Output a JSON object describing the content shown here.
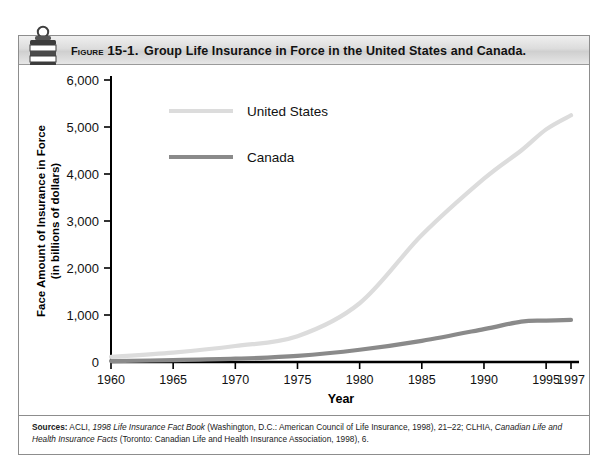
{
  "figure": {
    "label_word": "Figure",
    "label_number": "15-1.",
    "title": "Group Life Insurance in Force in the United States and Canada.",
    "icon": "ribbon-banner-icon"
  },
  "source": {
    "label": "Sources:",
    "segments": [
      {
        "text": " ACLI, ",
        "style": "normal"
      },
      {
        "text": "1998 Life Insurance Fact Book",
        "style": "italic"
      },
      {
        "text": " (Washington, D.C.: American Council of Life Insurance, 1998), 21–22; CLHIA, ",
        "style": "normal"
      },
      {
        "text": "Canadian Life and Health Insurance Facts",
        "style": "italic"
      },
      {
        "text": " (Toronto: Canadian Life and Health Insurance Association, 1998), 6.",
        "style": "normal"
      }
    ],
    "full_text": "Sources: ACLI, 1998 Life Insurance Fact Book (Washington, D.C.: American Council of Life Insurance, 1998), 21–22; CLHIA, Canadian Life and Health Insurance Facts (Toronto: Canadian Life and Health Insurance Association, 1998), 6."
  },
  "chart_data": {
    "type": "line",
    "title": "Group Life Insurance in Force in the United States and Canada.",
    "xlabel": "Year",
    "ylabel": "Face Amount of Insurance in Force\n(in billions of dollars)",
    "ylabel_line1": "Face Amount of Insurance in Force",
    "ylabel_line2": "(in billions of dollars)",
    "xlim": [
      1960,
      1997
    ],
    "ylim": [
      0,
      6000
    ],
    "xticks": [
      1960,
      1965,
      1970,
      1975,
      1980,
      1985,
      1990,
      1995,
      1997
    ],
    "xtick_labels": [
      "1960",
      "1965",
      "1970",
      "1975",
      "1980",
      "1985",
      "1990",
      "1995",
      "1997"
    ],
    "yticks": [
      0,
      1000,
      2000,
      3000,
      4000,
      5000,
      6000
    ],
    "ytick_labels": [
      "0",
      "1,000",
      "2,000",
      "3,000",
      "4,000",
      "5,000",
      "6,000"
    ],
    "grid": false,
    "legend_position": "upper-left-inside",
    "x": [
      1960,
      1965,
      1970,
      1975,
      1980,
      1985,
      1990,
      1993,
      1995,
      1997
    ],
    "series": [
      {
        "name": "United States",
        "color": "#dcdcdc",
        "values": [
          110,
          200,
          340,
          550,
          1250,
          2700,
          3900,
          4500,
          4950,
          5250
        ]
      },
      {
        "name": "Canada",
        "color": "#8a8a8a",
        "values": [
          20,
          40,
          70,
          130,
          260,
          450,
          700,
          860,
          880,
          895
        ]
      }
    ]
  },
  "axis_colors": {
    "axis": "#000000",
    "us_line": "#dcdcdc",
    "canada_line": "#8a8a8a"
  }
}
